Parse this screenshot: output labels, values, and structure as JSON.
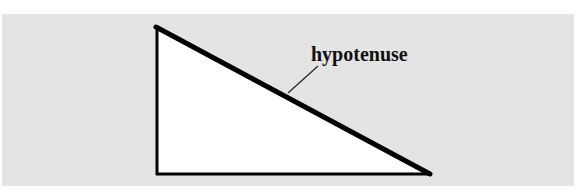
{
  "diagram": {
    "type": "right-triangle",
    "label": "hypotenuse",
    "colors": {
      "background": "#ffffff",
      "panel": "#e4e4e4",
      "triangle_fill": "#ffffff",
      "stroke": "#000000"
    },
    "vertices": {
      "top": [
        157,
        27
      ],
      "bottom_left": [
        157,
        174
      ],
      "bottom_right": [
        430,
        174
      ]
    }
  }
}
